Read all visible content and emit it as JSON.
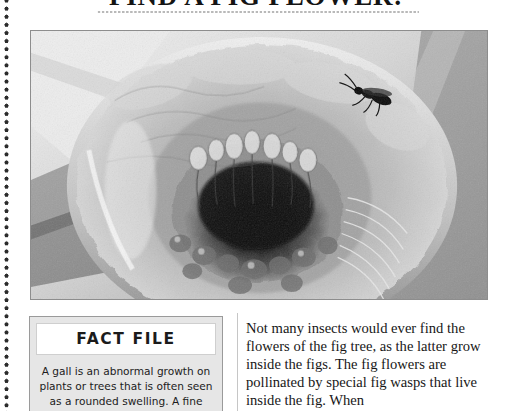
{
  "page": {
    "title": "FIND A FIG FLOWER!",
    "background_color": "#ffffff",
    "text_color": "#171717"
  },
  "decor": {
    "left_rule_name": "vertical-dotted-rule",
    "left_rule_color": "#2b2b2b",
    "title_rule_name": "horizontal-dotted-rule",
    "title_rule_color": "#b9b9b9",
    "column_divider_color": "#c6c6c6"
  },
  "photo": {
    "name": "fig-cross-section-photograph",
    "alt": "Black and white close-up photograph of a fig cut open lengthwise, showing the hollow interior packed with tiny fig flowers and a fig wasp crawling on the inner wall.",
    "border_color": "#8d8d8d",
    "is_monochrome": true
  },
  "fact_file": {
    "heading": "FACT FILE",
    "body": "A gall is an abnormal growth on plants or trees that is often seen as a rounded swelling. A fine",
    "panel_color": "#e6e6e6",
    "header_color": "#ffffff",
    "border_color": "#9a9a9a"
  },
  "body_copy": {
    "text": "Not many insects would ever find the flowers of the fig tree, as the latter grow inside the figs. The fig flowers are pollinated by special fig wasps that live inside the fig. When"
  }
}
